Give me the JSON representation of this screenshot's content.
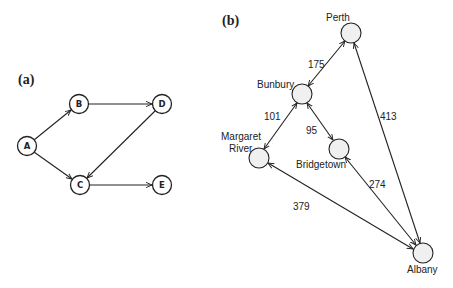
{
  "panel_a": {
    "label": "(a)",
    "nodes": [
      {
        "id": "A",
        "label": "A",
        "x": 27,
        "y": 146
      },
      {
        "id": "B",
        "label": "B",
        "x": 79,
        "y": 104
      },
      {
        "id": "C",
        "label": "C",
        "x": 80,
        "y": 185
      },
      {
        "id": "D",
        "label": "D",
        "x": 162,
        "y": 104
      },
      {
        "id": "E",
        "label": "E",
        "x": 162,
        "y": 185
      }
    ],
    "edges": [
      {
        "from": "A",
        "to": "B",
        "directed": true
      },
      {
        "from": "A",
        "to": "C",
        "directed": true
      },
      {
        "from": "B",
        "to": "D",
        "directed": true
      },
      {
        "from": "D",
        "to": "C",
        "directed": true
      },
      {
        "from": "C",
        "to": "E",
        "directed": true
      }
    ]
  },
  "panel_b": {
    "label": "(b)",
    "nodes": [
      {
        "id": "perth",
        "label": "Perth",
        "x": 351,
        "y": 33
      },
      {
        "id": "bunbury",
        "label": "Bunbury",
        "x": 302,
        "y": 94
      },
      {
        "id": "margaret_river",
        "label": "Margaret River",
        "label_lines": [
          "Margaret",
          "River"
        ],
        "x": 259,
        "y": 158
      },
      {
        "id": "bridgetown",
        "label": "Bridgetown",
        "x": 339,
        "y": 149
      },
      {
        "id": "albany",
        "label": "Albany",
        "x": 423,
        "y": 253
      }
    ],
    "edges": [
      {
        "from": "perth",
        "to": "bunbury",
        "weight": "175",
        "bidirectional": true
      },
      {
        "from": "bunbury",
        "to": "margaret_river",
        "weight": "101",
        "bidirectional": true
      },
      {
        "from": "bunbury",
        "to": "bridgetown",
        "weight": "95",
        "bidirectional": true
      },
      {
        "from": "perth",
        "to": "albany",
        "weight": "413",
        "bidirectional": true
      },
      {
        "from": "bridgetown",
        "to": "albany",
        "weight": "274",
        "bidirectional": true
      },
      {
        "from": "margaret_river",
        "to": "albany",
        "weight": "379",
        "bidirectional": true
      }
    ]
  }
}
